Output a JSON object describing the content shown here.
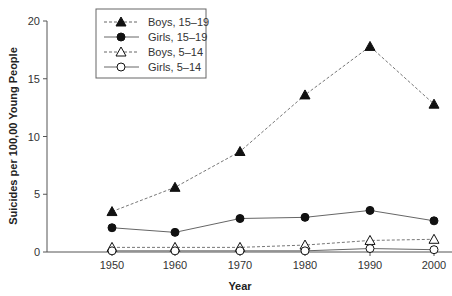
{
  "chart_data": {
    "type": "line",
    "title": "",
    "xlabel": "Year",
    "ylabel": "Suicides per 100,00 Young People",
    "x": [
      1950,
      1960,
      1970,
      1980,
      1990,
      2000
    ],
    "x_ticks": [
      "1950",
      "1960",
      "1970",
      "1980",
      "1990",
      "2000"
    ],
    "y_ticks": [
      "0",
      "5",
      "10",
      "15",
      "20"
    ],
    "ylim": [
      0,
      20
    ],
    "grid": false,
    "legend_position": "upper-left-inside",
    "series": [
      {
        "name": "Boys, 15–19",
        "marker": "filled-triangle",
        "line": "dashed",
        "values": [
          3.5,
          5.6,
          8.7,
          13.6,
          17.8,
          12.8
        ]
      },
      {
        "name": "Girls, 15–19",
        "marker": "filled-circle",
        "line": "solid",
        "values": [
          2.1,
          1.7,
          2.9,
          3.0,
          3.6,
          2.7
        ]
      },
      {
        "name": "Boys, 5–14",
        "marker": "open-triangle",
        "line": "dashed",
        "values": [
          0.4,
          0.4,
          0.4,
          0.6,
          1.0,
          1.1
        ]
      },
      {
        "name": "Girls, 5–14",
        "marker": "open-circle",
        "line": "solid",
        "values": [
          0.1,
          0.1,
          0.1,
          0.1,
          0.3,
          0.2
        ]
      }
    ]
  }
}
